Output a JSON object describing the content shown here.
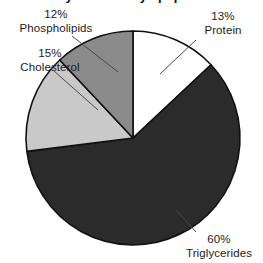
{
  "chart": {
    "title": "Very low density lipoprotein",
    "center_x": 133,
    "center_y": 138,
    "radius": 107
  },
  "chart_data": {
    "type": "pie",
    "title": "Very low density lipoprotein",
    "xlabel": "",
    "ylabel": "",
    "legend_position": "none",
    "grid": false,
    "start_angle_deg": 0,
    "direction": "clockwise",
    "categories": [
      "Protein",
      "Triglycerides",
      "Cholesterol",
      "Phospholipids"
    ],
    "values": [
      13,
      60,
      15,
      12
    ],
    "unit": "%",
    "colors": [
      "#ffffff",
      "#2b2b2b",
      "#c9c9c9",
      "#8b8b8b"
    ],
    "slices": [
      {
        "name": "Protein",
        "value": 13,
        "label_pct": "13%",
        "color": "#ffffff",
        "edge": "#111111"
      },
      {
        "name": "Triglycerides",
        "value": 60,
        "label_pct": "60%",
        "color": "#2b2b2b",
        "edge": "#111111"
      },
      {
        "name": "Cholesterol",
        "value": 15,
        "label_pct": "15%",
        "color": "#c9c9c9",
        "edge": "#111111"
      },
      {
        "name": "Phospholipids",
        "value": 12,
        "label_pct": "12%",
        "color": "#8b8b8b",
        "edge": "#111111"
      }
    ]
  },
  "labels": {
    "phospholipids": {
      "pct": "12%",
      "name": "Phospholipids"
    },
    "protein": {
      "pct": "13%",
      "name": "Protein"
    },
    "cholesterol": {
      "pct": "15%",
      "name": "Cholesterol"
    },
    "triglycerides": {
      "pct": "60%",
      "name": "Triglycerides"
    }
  }
}
